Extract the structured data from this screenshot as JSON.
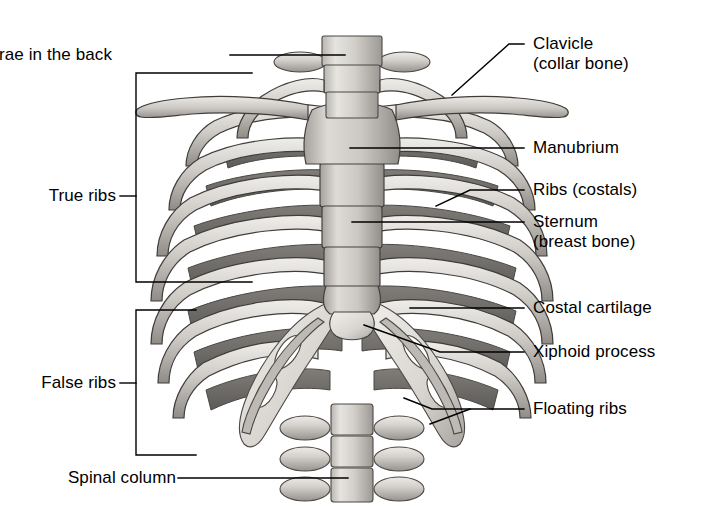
{
  "figure": {
    "background_color": "#ffffff",
    "line_color": "#000000",
    "width": 704,
    "height": 512
  },
  "labels": {
    "vertebrae": "Vertebrae in the back",
    "true_ribs": "True ribs",
    "false_ribs": "False ribs",
    "spinal_column": "Spinal column",
    "clavicle_l1": "Clavicle",
    "clavicle_l2": "(collar bone)",
    "manubrium": "Manubrium",
    "ribs_costals": "Ribs (costals)",
    "sternum_l1": "Sternum",
    "sternum_l2": "(breast bone)",
    "costal_cartilage": "Costal cartilage",
    "xiphoid": "Xiphoid process",
    "floating_ribs": "Floating ribs"
  },
  "brackets": {
    "true_ribs_span": "73-282",
    "false_ribs_span": "310-455"
  },
  "colors": {
    "bone_light": "#e4e2de",
    "bone_mid": "#c3c0bb",
    "bone_dark": "#8d8a86",
    "rib_posterior": "#6f6d6a",
    "outline": "#3a3a3a",
    "cartilage": "#d9d7d2"
  }
}
